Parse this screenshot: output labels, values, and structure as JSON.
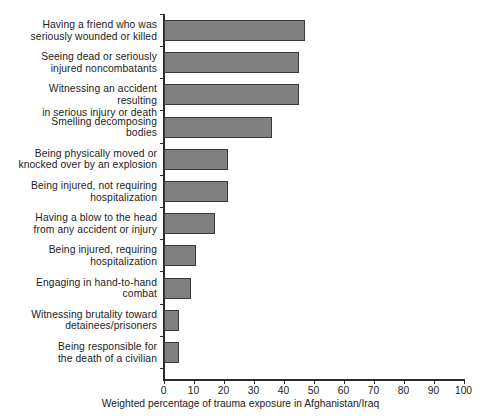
{
  "chart_data": {
    "type": "bar",
    "orientation": "horizontal",
    "title": "",
    "subtitle": "",
    "xlabel": "Weighted percentage of trauma exposure in Afghanistan/Iraq",
    "ylabel": "",
    "xlim": [
      0,
      100
    ],
    "xticks": [
      0,
      10,
      20,
      30,
      40,
      50,
      60,
      70,
      80,
      90,
      100
    ],
    "xtick_labels": [
      "0",
      "10",
      "20",
      "30",
      "40",
      "50",
      "60",
      "70",
      "80",
      "90",
      "100"
    ],
    "grid": false,
    "legend": null,
    "bar_color": "#808080",
    "bar_edge_color": "#3a3a3a",
    "axis_color": "#2b2b2b",
    "categories": [
      "Having a friend who was seriously wounded or killed",
      "Seeing dead or seriously injured noncombatants",
      "Witnessing an accident resulting in serious injury or death",
      "Smelling decomposing bodies",
      "Being physically moved or knocked over by an explosion",
      "Being injured, not requiring hospitalization",
      "Having a blow to the head from any accident or injury",
      "Being injured, requiring hospitalization",
      "Engaging in hand-to-hand combat",
      "Witnessing brutality toward detainees/prisoners",
      "Being responsible for the death of a civilian"
    ],
    "category_lines": [
      [
        "Having a friend who was",
        "seriously wounded or killed"
      ],
      [
        "Seeing dead or seriously",
        "injured noncombatants"
      ],
      [
        "Witnessing an accident resulting",
        "in serious injury or death"
      ],
      [
        "Smelling decomposing",
        "bodies"
      ],
      [
        "Being physically moved or",
        "knocked over by an explosion"
      ],
      [
        "Being injured, not requiring",
        "hospitalization"
      ],
      [
        "Having a blow to the head",
        "from any accident or injury"
      ],
      [
        "Being injured, requiring",
        "hospitalization"
      ],
      [
        "Engaging in hand-to-hand",
        "combat"
      ],
      [
        "Witnessing brutality toward",
        "detainees/prisoners"
      ],
      [
        "Being responsible for",
        "the death of a civilian"
      ]
    ],
    "values": [
      47,
      45,
      45,
      36,
      21.5,
      21.5,
      17,
      10.7,
      9.3,
      5,
      5
    ]
  }
}
